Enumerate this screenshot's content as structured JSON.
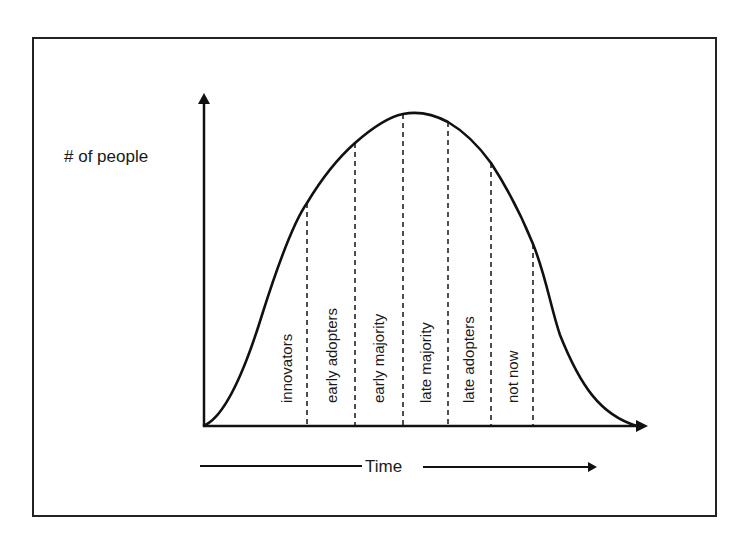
{
  "diagram": {
    "y_axis_label": "# of people",
    "x_axis_label": "Time",
    "segments": [
      {
        "label": "innovators",
        "x": 287
      },
      {
        "label": "early adopters",
        "x": 332
      },
      {
        "label": "early majority",
        "x": 379
      },
      {
        "label": "late majority",
        "x": 426
      },
      {
        "label": "late adopters",
        "x": 469
      },
      {
        "label": "not now",
        "x": 513
      }
    ],
    "dividers": [
      {
        "x": 307,
        "y_top": 203
      },
      {
        "x": 355,
        "y_top": 143
      },
      {
        "x": 403,
        "y_top": 114
      },
      {
        "x": 448,
        "y_top": 122
      },
      {
        "x": 491,
        "y_top": 163
      },
      {
        "x": 533,
        "y_top": 244
      }
    ],
    "colors": {
      "ink": "#111111",
      "background": "#ffffff"
    }
  }
}
